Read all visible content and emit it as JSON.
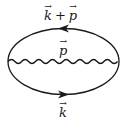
{
  "diagram": {
    "type": "feynman-loop",
    "line_color": "#1a1a1a",
    "top_propagator": {
      "label_momentum_1": "k",
      "label_operator": "+",
      "label_momentum_2": "p",
      "arrow_direction": "left"
    },
    "middle_propagator": {
      "label": "p",
      "style": "wavy"
    },
    "bottom_propagator": {
      "label": "k",
      "arrow_direction": "right"
    }
  }
}
